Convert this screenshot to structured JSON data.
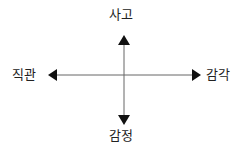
{
  "diagram": {
    "type": "cross-axes",
    "labels": {
      "top": "사고",
      "bottom": "감정",
      "left": "직관",
      "right": "감각"
    },
    "colors": {
      "line": "#555555",
      "arrow": "#111111",
      "text": "#222222",
      "background": "#ffffff"
    }
  }
}
